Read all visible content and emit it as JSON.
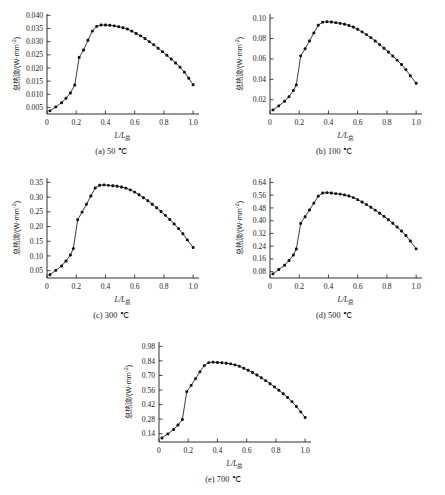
{
  "figure": {
    "axis_labels": {
      "y_cn": "总热流",
      "y_unit": "/(W·mm",
      "y_exp": "-2",
      "y_close": ")",
      "x_main": "L/L",
      "x_sub": "总"
    }
  },
  "chart_data": [
    {
      "id": "a",
      "type": "line",
      "title": "(a) 50 ℃",
      "xlabel": "L/L总",
      "ylabel": "总热流/(W·mm⁻²)",
      "xlim": [
        0,
        1.04
      ],
      "ylim": [
        0.0025,
        0.0405
      ],
      "xticks": [
        0,
        0.2,
        0.4,
        0.6,
        0.8,
        1.0
      ],
      "xticklabels": [
        "0",
        "0.2",
        "0.4",
        "0.6",
        "0.8",
        "1.0"
      ],
      "yticks": [
        0.005,
        0.01,
        0.015,
        0.02,
        0.025,
        0.03,
        0.035,
        0.04
      ],
      "yticklabels": [
        "0.005",
        "0.010",
        "0.015",
        "0.020",
        "0.025",
        "0.030",
        "0.035",
        "0.040"
      ],
      "grid": false,
      "legend": null,
      "x": [
        0.02,
        0.06,
        0.1,
        0.13,
        0.16,
        0.19,
        0.22,
        0.25,
        0.28,
        0.31,
        0.34,
        0.37,
        0.4,
        0.43,
        0.46,
        0.49,
        0.52,
        0.55,
        0.58,
        0.61,
        0.64,
        0.67,
        0.7,
        0.73,
        0.76,
        0.79,
        0.82,
        0.85,
        0.88,
        0.91,
        0.94,
        0.97,
        1.0
      ],
      "y": [
        0.0037,
        0.0052,
        0.0068,
        0.0085,
        0.0105,
        0.0135,
        0.024,
        0.0268,
        0.0305,
        0.034,
        0.0358,
        0.0363,
        0.0363,
        0.0362,
        0.036,
        0.0357,
        0.0353,
        0.0348,
        0.034,
        0.0331,
        0.0322,
        0.0312,
        0.03,
        0.0288,
        0.0275,
        0.0262,
        0.0248,
        0.0234,
        0.0219,
        0.0203,
        0.0184,
        0.0161,
        0.0136
      ]
    },
    {
      "id": "b",
      "type": "line",
      "title": "(b) 100 ℃",
      "xlabel": "L/L总",
      "ylabel": "总热流/(W·mm⁻²)",
      "xlim": [
        0,
        1.04
      ],
      "ylim": [
        0.006,
        0.104
      ],
      "xticks": [
        0,
        0.2,
        0.4,
        0.6,
        0.8,
        1.0
      ],
      "xticklabels": [
        "0",
        "0.2",
        "0.4",
        "0.6",
        "0.8",
        "1.0"
      ],
      "yticks": [
        0.02,
        0.04,
        0.06,
        0.08,
        0.1
      ],
      "yticklabels": [
        "0.02",
        "0.04",
        "0.06",
        "0.08",
        "0.10"
      ],
      "grid": false,
      "legend": null,
      "x": [
        0.02,
        0.06,
        0.1,
        0.13,
        0.16,
        0.18,
        0.21,
        0.24,
        0.27,
        0.3,
        0.33,
        0.36,
        0.39,
        0.42,
        0.45,
        0.48,
        0.51,
        0.54,
        0.57,
        0.6,
        0.63,
        0.66,
        0.69,
        0.72,
        0.75,
        0.78,
        0.81,
        0.84,
        0.87,
        0.9,
        0.93,
        0.96,
        1.0
      ],
      "y": [
        0.01,
        0.014,
        0.0185,
        0.023,
        0.029,
        0.0345,
        0.063,
        0.07,
        0.0775,
        0.0855,
        0.093,
        0.096,
        0.0965,
        0.0962,
        0.0955,
        0.0948,
        0.094,
        0.0928,
        0.0912,
        0.089,
        0.0865,
        0.0838,
        0.0808,
        0.0775,
        0.074,
        0.0705,
        0.0668,
        0.0628,
        0.0588,
        0.0545,
        0.0495,
        0.0435,
        0.0362
      ]
    },
    {
      "id": "c",
      "type": "line",
      "title": "(c) 300 ℃",
      "xlabel": "L/L总",
      "ylabel": "总热流/(W·mm⁻²)",
      "xlim": [
        0,
        1.04
      ],
      "ylim": [
        0.025,
        0.365
      ],
      "xticks": [
        0,
        0.2,
        0.4,
        0.6,
        0.8,
        1.0
      ],
      "xticklabels": [
        "0",
        "0.2",
        "0.4",
        "0.6",
        "0.8",
        "1.0"
      ],
      "yticks": [
        0.05,
        0.1,
        0.15,
        0.2,
        0.25,
        0.3,
        0.35
      ],
      "yticklabels": [
        "0.05",
        "0.10",
        "0.15",
        "0.20",
        "0.25",
        "0.30",
        "0.35"
      ],
      "grid": false,
      "legend": null,
      "x": [
        0.02,
        0.06,
        0.1,
        0.13,
        0.16,
        0.18,
        0.21,
        0.24,
        0.27,
        0.3,
        0.33,
        0.36,
        0.39,
        0.42,
        0.45,
        0.48,
        0.51,
        0.54,
        0.57,
        0.6,
        0.63,
        0.66,
        0.69,
        0.72,
        0.75,
        0.78,
        0.81,
        0.84,
        0.87,
        0.9,
        0.93,
        0.96,
        1.0
      ],
      "y": [
        0.036,
        0.051,
        0.066,
        0.083,
        0.103,
        0.125,
        0.223,
        0.249,
        0.276,
        0.304,
        0.331,
        0.3405,
        0.3415,
        0.34,
        0.3385,
        0.337,
        0.3345,
        0.3305,
        0.3245,
        0.317,
        0.308,
        0.298,
        0.2875,
        0.276,
        0.264,
        0.251,
        0.238,
        0.224,
        0.209,
        0.193,
        0.1755,
        0.1545,
        0.1285
      ]
    },
    {
      "id": "d",
      "type": "line",
      "title": "(d) 500 ℃",
      "xlabel": "L/L总",
      "ylabel": "总热流/(W·mm⁻²)",
      "xlim": [
        0,
        1.04
      ],
      "ylim": [
        0.04,
        0.668
      ],
      "xticks": [
        0,
        0.2,
        0.4,
        0.6,
        0.8,
        1.0
      ],
      "xticklabels": [
        "0",
        "0.2",
        "0.4",
        "0.6",
        "0.8",
        "1.0"
      ],
      "yticks": [
        0.08,
        0.16,
        0.24,
        0.32,
        0.4,
        0.48,
        0.56,
        0.64
      ],
      "yticklabels": [
        "0.08",
        "0.16",
        "0.24",
        "0.32",
        "0.40",
        "0.48",
        "0.56",
        "0.64"
      ],
      "grid": false,
      "legend": null,
      "x": [
        0.02,
        0.06,
        0.1,
        0.13,
        0.16,
        0.18,
        0.21,
        0.24,
        0.27,
        0.3,
        0.33,
        0.36,
        0.39,
        0.42,
        0.45,
        0.48,
        0.51,
        0.54,
        0.57,
        0.6,
        0.63,
        0.66,
        0.69,
        0.72,
        0.75,
        0.78,
        0.81,
        0.84,
        0.87,
        0.9,
        0.93,
        0.96,
        1.0
      ],
      "y": [
        0.066,
        0.093,
        0.12,
        0.15,
        0.184,
        0.222,
        0.383,
        0.425,
        0.467,
        0.51,
        0.554,
        0.574,
        0.576,
        0.574,
        0.57,
        0.567,
        0.562,
        0.555,
        0.545,
        0.532,
        0.517,
        0.501,
        0.484,
        0.466,
        0.447,
        0.427,
        0.406,
        0.384,
        0.36,
        0.335,
        0.307,
        0.272,
        0.223
      ]
    },
    {
      "id": "e",
      "type": "line",
      "title": "(e) 700 ℃",
      "xlabel": "L/L总",
      "ylabel": "总热流/(W·mm⁻²)",
      "xlim": [
        0,
        1.04
      ],
      "ylim": [
        0.06,
        1.022
      ],
      "xticks": [
        0,
        0.2,
        0.4,
        0.6,
        0.8,
        1.0
      ],
      "xticklabels": [
        "0",
        "0.2",
        "0.4",
        "0.6",
        "0.8",
        "1.0"
      ],
      "yticks": [
        0.14,
        0.28,
        0.42,
        0.56,
        0.7,
        0.84,
        0.98
      ],
      "yticklabels": [
        "0.14",
        "0.28",
        "0.42",
        "0.56",
        "0.70",
        "0.84",
        "0.98"
      ],
      "grid": false,
      "legend": null,
      "x": [
        0.02,
        0.06,
        0.1,
        0.13,
        0.16,
        0.19,
        0.22,
        0.25,
        0.28,
        0.31,
        0.34,
        0.37,
        0.4,
        0.43,
        0.46,
        0.49,
        0.52,
        0.55,
        0.58,
        0.61,
        0.64,
        0.67,
        0.7,
        0.73,
        0.76,
        0.79,
        0.82,
        0.85,
        0.88,
        0.91,
        0.94,
        0.97,
        1.0
      ],
      "y": [
        0.098,
        0.138,
        0.18,
        0.224,
        0.276,
        0.545,
        0.605,
        0.67,
        0.735,
        0.795,
        0.824,
        0.828,
        0.825,
        0.822,
        0.818,
        0.812,
        0.802,
        0.788,
        0.77,
        0.75,
        0.728,
        0.704,
        0.678,
        0.65,
        0.621,
        0.59,
        0.558,
        0.524,
        0.488,
        0.448,
        0.402,
        0.35,
        0.295
      ]
    }
  ]
}
